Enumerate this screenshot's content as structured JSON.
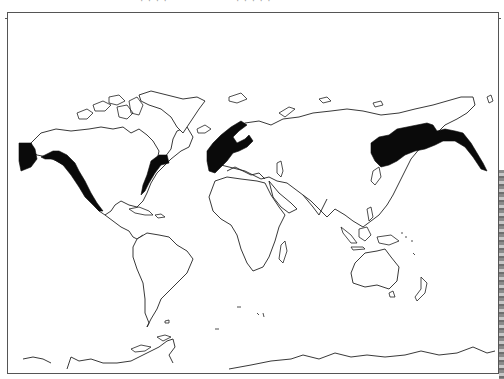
{
  "page": {
    "top_text_fragments": [
      "· · ·  ·",
      "· ·  · · ·"
    ],
    "frame_border_color": "#555555",
    "background_color": "#ffffff"
  },
  "map": {
    "type": "world-outline-map",
    "projection": "Mercator-like world outline",
    "outline_color": "#222222",
    "shade_color": "#0a0a0a",
    "continents": [
      "North America",
      "Greenland",
      "South America",
      "Europe",
      "Africa",
      "Asia",
      "Australia",
      "New Zealand",
      "Antarctica"
    ],
    "shaded_regions": [
      {
        "id": "alaska-pacific-northwest",
        "description": "Western Alaska and Pacific coast of North America down to Baja California"
      },
      {
        "id": "north-america-east-coast",
        "description": "New England / Atlantic Canada coast southward along the eastern seaboard"
      },
      {
        "id": "northwest-europe",
        "description": "British Isles, Norway, Sweden, and western coastal Europe"
      },
      {
        "id": "northeast-asia",
        "description": "Russian Far East, Sea of Okhotsk, Kamchatka and Bering coast, northeast China / Korea region"
      }
    ]
  }
}
